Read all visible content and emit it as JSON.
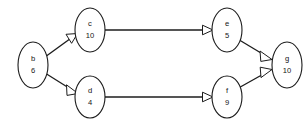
{
  "graph": {
    "title": "",
    "background_color": "#ffffff",
    "stroke_color": "#1c1c1c",
    "node_fill_color": "#ffffff",
    "text_color": "#141414",
    "arrowhead_style": "hollow-triangle",
    "nodes": [
      {
        "id": "b",
        "label": "b",
        "value": "6",
        "cx": 33,
        "cy": 65,
        "rx": 15,
        "ry": 23
      },
      {
        "id": "c",
        "label": "c",
        "value": "10",
        "cx": 90,
        "cy": 30,
        "rx": 15,
        "ry": 22
      },
      {
        "id": "d",
        "label": "d",
        "value": "4",
        "cx": 90,
        "cy": 97,
        "rx": 15,
        "ry": 21
      },
      {
        "id": "e",
        "label": "e",
        "value": "5",
        "cx": 227,
        "cy": 30,
        "rx": 15,
        "ry": 22
      },
      {
        "id": "f",
        "label": "f",
        "value": "9",
        "cx": 227,
        "cy": 97,
        "rx": 15,
        "ry": 21
      },
      {
        "id": "g",
        "label": "g",
        "value": "10",
        "cx": 287,
        "cy": 65,
        "rx": 15,
        "ry": 23
      }
    ],
    "edges": [
      {
        "id": "b-c",
        "from": "b",
        "to": "c",
        "label": ""
      },
      {
        "id": "b-d",
        "from": "b",
        "to": "d",
        "label": ""
      },
      {
        "id": "c-e",
        "from": "c",
        "to": "e",
        "label": ""
      },
      {
        "id": "d-f",
        "from": "d",
        "to": "f",
        "label": ""
      },
      {
        "id": "e-g",
        "from": "e",
        "to": "g",
        "label": ""
      },
      {
        "id": "f-g",
        "from": "f",
        "to": "g",
        "label": ""
      }
    ]
  }
}
